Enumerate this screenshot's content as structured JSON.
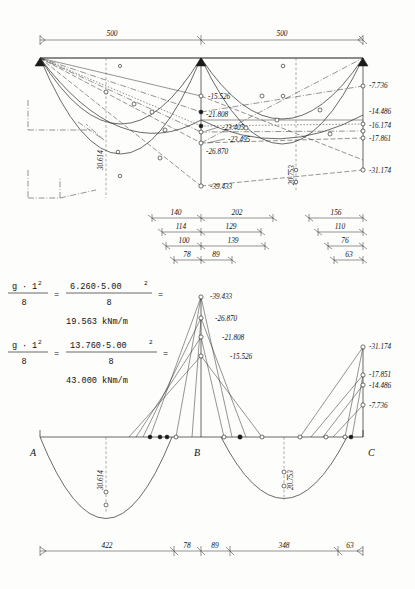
{
  "sheet": {
    "title": "Continuous beam bending moment envelope and tendon layout"
  },
  "top_diagram": {
    "spans": [
      {
        "label": "500",
        "from": "A",
        "to": "B"
      },
      {
        "label": "500",
        "from": "B",
        "to": "C"
      }
    ],
    "moment_labels_midB": [
      "-15.526",
      "-21.808",
      "-23.405",
      "-23.495",
      "-26.870",
      "-39.433"
    ],
    "moment_labels_right": [
      "-7.736",
      "-14.486",
      "-16.174",
      "-17.861",
      "-31.174"
    ],
    "span_value_left": "30.614",
    "span_value_right": "20.753"
  },
  "dimension_chains": {
    "left_group": [
      {
        "a": "140",
        "b": "202"
      },
      {
        "a": "114",
        "b": "129"
      },
      {
        "a": "100",
        "b": "139"
      },
      {
        "a": "78",
        "b": "89"
      }
    ],
    "right_group": [
      {
        "a": "156"
      },
      {
        "a": "110"
      },
      {
        "a": "76"
      },
      {
        "a": "63"
      }
    ]
  },
  "formulas": [
    {
      "num_sym": "g",
      "num_exp": "2",
      "den": "8",
      "rhs_num": "6.260·5.00",
      "rhs_exp": "2",
      "rhs_den": "8",
      "result": "19.563  kNm/m",
      "eq1": "=",
      "eq2": "=",
      "dot": "·",
      "var": "1"
    },
    {
      "num_sym": "g",
      "num_exp": "2",
      "den": "8",
      "rhs_num": "13.760·5.00",
      "rhs_exp": "2",
      "rhs_den": "8",
      "result": "43.000  kNm/m",
      "eq1": "=",
      "eq2": "=",
      "dot": "·",
      "var": "1"
    }
  ],
  "bottom_diagram": {
    "supports": [
      "A",
      "B",
      "C"
    ],
    "moment_labels_B": [
      "-39.433",
      "-26.870",
      "-21.808",
      "-15.526"
    ],
    "moment_labels_C": [
      "-31.174",
      "-17.851",
      "-14.486",
      "-7.736"
    ],
    "span_value_left": "30.614",
    "span_value_right": "20.753",
    "bottom_dims": [
      "422",
      "78",
      "89",
      "348",
      "63"
    ]
  },
  "colors": {
    "ink": "#1b1b1b",
    "paper": "#fdfdfc",
    "thin": "#2a2a2a"
  }
}
